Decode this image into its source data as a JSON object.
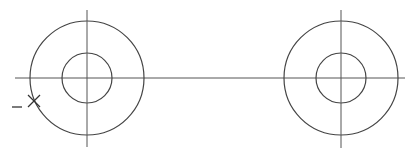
{
  "drawing": {
    "background": "#ffffff",
    "stroke_color": "#444444",
    "centerline": {
      "x1": 15,
      "y": 78,
      "x2": 405
    },
    "circles": [
      {
        "id": "left",
        "cx": 87,
        "cy": 78,
        "outer_r": 57,
        "inner_r": 25,
        "vline_top": 10,
        "vline_bottom": 147
      },
      {
        "id": "right",
        "cx": 341,
        "cy": 78,
        "outer_r": 57,
        "inner_r": 25,
        "vline_top": 10,
        "vline_bottom": 148
      }
    ],
    "cursor_mark": {
      "cx": 34,
      "cy": 101,
      "size": 6,
      "dash_x1": 12,
      "dash_x2": 22,
      "dash_y": 107
    }
  }
}
